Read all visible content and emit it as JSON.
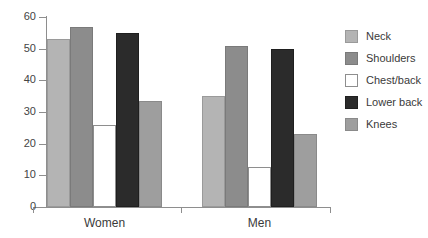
{
  "chart_data": {
    "type": "bar",
    "title": "",
    "xlabel": "",
    "ylabel": "",
    "ylim": [
      0,
      60
    ],
    "yticks": [
      0,
      10,
      20,
      30,
      40,
      50,
      60
    ],
    "grid": false,
    "legend_position": "right",
    "categories": [
      "Women",
      "Men"
    ],
    "series": [
      {
        "name": "Neck",
        "color": "#b4b4b4",
        "values": [
          53,
          35
        ]
      },
      {
        "name": "Shoulders",
        "color": "#8c8c8c",
        "values": [
          57,
          51
        ]
      },
      {
        "name": "Chest/back",
        "color": "#ffffff",
        "values": [
          26,
          12.5
        ]
      },
      {
        "name": "Lower back",
        "color": "#2b2b2b",
        "values": [
          55,
          50
        ]
      },
      {
        "name": "Knees",
        "color": "#9e9e9e",
        "values": [
          33.5,
          23
        ]
      }
    ]
  },
  "axis": {
    "tick_labels": [
      "60",
      "50",
      "40",
      "30",
      "20",
      "10",
      "0"
    ]
  },
  "groups": [
    {
      "label": "Women"
    },
    {
      "label": "Men"
    }
  ],
  "legend": {
    "items": [
      {
        "label": "Neck"
      },
      {
        "label": "Shoulders"
      },
      {
        "label": "Chest/back"
      },
      {
        "label": "Lower back"
      },
      {
        "label": "Knees"
      }
    ]
  },
  "caption": {
    "text": ""
  }
}
